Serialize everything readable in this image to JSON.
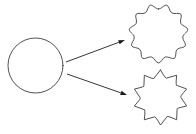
{
  "diagram": {
    "background_color": "#ffffff",
    "stroke_color": "#3d3d3d",
    "arrow_color": "#1c1c1c",
    "canvas": {
      "width": 196,
      "height": 134
    },
    "source_shape": {
      "name": "circle",
      "label": "circle",
      "center_x": 35.5,
      "center_y": 65.5,
      "radius": 27.5,
      "fill": "none"
    },
    "target_shapes": [
      {
        "name": "scalloped-cloud",
        "label": "scalloped shape",
        "center_x": 158.5,
        "center_y": 33.5,
        "outer_radius": 29.5,
        "inner_radius": 24.5,
        "lobes": 11,
        "style": "rounded-bumps",
        "fill": "none"
      },
      {
        "name": "spiked-star",
        "label": "spiked shape",
        "center_x": 160.5,
        "center_y": 97.5,
        "outer_radius": 27.5,
        "inner_radius": 20.5,
        "points": 10,
        "style": "sharp-spikes",
        "fill": "none"
      }
    ],
    "arrows": [
      {
        "name": "arrow-to-scalloped",
        "label": "arrow from circle to scalloped shape",
        "x1": 66,
        "y1": 62,
        "x2": 125,
        "y2": 40,
        "head_size": 6.5
      },
      {
        "name": "arrow-to-spiked",
        "label": "arrow from circle to spiked shape",
        "x1": 67,
        "y1": 74,
        "x2": 127,
        "y2": 95,
        "head_size": 6.5
      }
    ]
  }
}
